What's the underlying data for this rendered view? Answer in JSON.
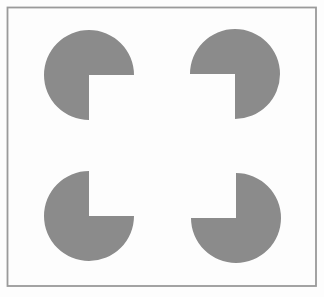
{
  "canvas": {
    "width": 324,
    "height": 297,
    "background_color": "#fdfdfd"
  },
  "figure": {
    "frame": {
      "x": 7.5,
      "y": 7.5,
      "width": 308.5,
      "height": 278.5,
      "stroke_color": "#9a9a9a",
      "stroke_width": 1.8,
      "fill_color": "none"
    },
    "pacman_color": "#8b8b8b",
    "pacman_radius": 45,
    "pacmen": [
      {
        "id": "top-left",
        "cx": 89,
        "cy": 75,
        "mouth": "se"
      },
      {
        "id": "top-right",
        "cx": 235,
        "cy": 74,
        "mouth": "sw"
      },
      {
        "id": "bottom-left",
        "cx": 89,
        "cy": 216,
        "mouth": "ne"
      },
      {
        "id": "bottom-right",
        "cx": 236,
        "cy": 218,
        "mouth": "nw"
      }
    ]
  }
}
